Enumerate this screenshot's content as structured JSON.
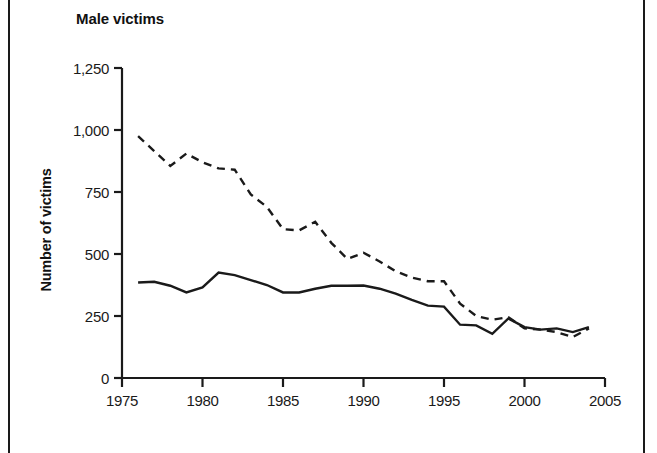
{
  "figure": {
    "width": 657,
    "height": 453,
    "background_color": "#ffffff",
    "frame_color": "#1a1a1a",
    "ink_color": "#1a1a1a"
  },
  "chart_data": {
    "type": "line",
    "title": "Male victims",
    "subtitle": "",
    "xlabel": "",
    "ylabel": "Number of victims",
    "xlim": [
      1975,
      2005
    ],
    "ylim": [
      0,
      1250
    ],
    "xticks": [
      1975,
      1980,
      1985,
      1990,
      1995,
      2000,
      2005
    ],
    "xtick_labels": [
      "1975",
      "1980",
      "1985",
      "1990",
      "1995",
      "2000",
      "2005"
    ],
    "yticks": [
      0,
      250,
      500,
      750,
      1000,
      1250
    ],
    "ytick_labels": [
      "0",
      "250",
      "500",
      "750",
      "1,000",
      "1,250"
    ],
    "grid": false,
    "legend": "none",
    "x": [
      1976,
      1977,
      1978,
      1979,
      1980,
      1981,
      1982,
      1983,
      1984,
      1985,
      1986,
      1987,
      1988,
      1989,
      1990,
      1991,
      1992,
      1993,
      1994,
      1995,
      1996,
      1997,
      1998,
      1999,
      2000,
      2001,
      2002,
      2003,
      2004
    ],
    "series": [
      {
        "name": "dashed-series",
        "style": "dashed",
        "color": "#1a1a1a",
        "values": [
          975,
          915,
          855,
          905,
          870,
          845,
          840,
          740,
          690,
          600,
          595,
          630,
          545,
          480,
          505,
          470,
          430,
          405,
          390,
          390,
          300,
          250,
          235,
          245,
          200,
          195,
          185,
          165,
          200
        ]
      },
      {
        "name": "solid-series",
        "style": "solid",
        "color": "#1a1a1a",
        "values": [
          385,
          388,
          372,
          345,
          365,
          425,
          415,
          395,
          375,
          345,
          345,
          360,
          372,
          372,
          373,
          360,
          340,
          315,
          292,
          288,
          215,
          212,
          178,
          240,
          205,
          195,
          200,
          185,
          205
        ]
      }
    ]
  }
}
